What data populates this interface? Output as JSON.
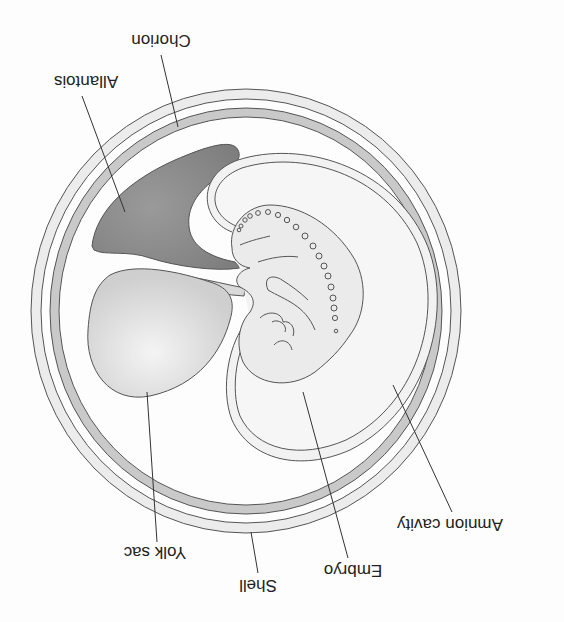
{
  "figure": {
    "orientation_deg": 180,
    "colors": {
      "background": "#fdfdfd",
      "outline": "#555555",
      "shell_fill": "#ececec",
      "chorion_fill": "#c9c9c9",
      "allantois_fill": "#8f8f8f",
      "yolk_fill": "#d6d6d6",
      "embryo_fill": "#ebebeb",
      "amnion_fill": "#f2f2f2"
    },
    "labels": {
      "chorion": "Chorion",
      "allantois": "Allantois",
      "yolk_sac": "Yolk sac",
      "shell": "Shell",
      "embryo": "Embryo",
      "amnion_cavity": "Amnion cavity"
    }
  }
}
